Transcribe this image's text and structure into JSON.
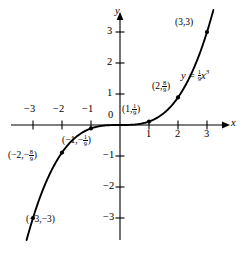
{
  "figure": {
    "caption": ""
  },
  "axes": {
    "x_axis_name": "x",
    "y_axis_name": "y",
    "origin_label": "0",
    "x_ticks": [
      {
        "value": -3,
        "label": "−3"
      },
      {
        "value": -2,
        "label": "−2"
      },
      {
        "value": -1,
        "label": "−1"
      },
      {
        "value": 1,
        "label": "1"
      },
      {
        "value": 2,
        "label": "2"
      },
      {
        "value": 3,
        "label": "3"
      }
    ],
    "y_ticks": [
      {
        "value": 3,
        "label": "3"
      },
      {
        "value": 2,
        "label": "2"
      },
      {
        "value": 1,
        "label": "1"
      },
      {
        "value": -1,
        "label": "−1"
      },
      {
        "value": -2,
        "label": "−2"
      },
      {
        "value": -3,
        "label": "−3"
      }
    ]
  },
  "equation": {
    "lhs": "y",
    "equals": "=",
    "coefficient_numerator": "1",
    "coefficient_denominator": "9",
    "variable": "x",
    "exponent": "3"
  },
  "points": [
    {
      "name": "point-neg3",
      "x": -3,
      "y": -3,
      "open": "(",
      "x_text": "−3,",
      "y_text": "−3",
      "close": ")",
      "has_fraction": false
    },
    {
      "name": "point-neg2",
      "x": -2,
      "y": -0.8889,
      "open": "(",
      "x_text": "−2,",
      "y_text": "−",
      "frac_num": "8",
      "frac_den": "9",
      "close": ")",
      "has_fraction": true
    },
    {
      "name": "point-neg1",
      "x": -1,
      "y": -0.1111,
      "open": "(",
      "x_text": "−1,",
      "y_text": "−",
      "frac_num": "1",
      "frac_den": "9",
      "close": ")",
      "has_fraction": true
    },
    {
      "name": "point-pos1",
      "x": 1,
      "y": 0.1111,
      "open": "(",
      "x_text": "1,",
      "y_text": "",
      "frac_num": "1",
      "frac_den": "9",
      "close": ")",
      "has_fraction": true
    },
    {
      "name": "point-pos2",
      "x": 2,
      "y": 0.8889,
      "open": "(",
      "x_text": "2,",
      "y_text": "",
      "frac_num": "8",
      "frac_den": "9",
      "close": ")",
      "has_fraction": true
    },
    {
      "name": "point-pos3",
      "x": 3,
      "y": 3,
      "open": "(",
      "x_text": "3,",
      "y_text": "3",
      "close": ")",
      "has_fraction": false
    }
  ],
  "colors": {
    "curve": "#000000",
    "axis": "#000000",
    "background": "#ffffff",
    "text": "#000000"
  },
  "chart_data": {
    "type": "line",
    "title": "",
    "xlabel": "x",
    "ylabel": "y",
    "xlim": [
      -3.6,
      3.6
    ],
    "ylim": [
      -3.6,
      3.6
    ],
    "grid": false,
    "legend": false,
    "function": "y = (1/9) x^3",
    "xticks": [
      -3,
      -2,
      -1,
      0,
      1,
      2,
      3
    ],
    "yticks": [
      -3,
      -2,
      -1,
      0,
      1,
      2,
      3
    ],
    "series": [
      {
        "name": "y = (1/9)x^3",
        "x": [
          -3.2,
          -3,
          -2.5,
          -2,
          -1.5,
          -1,
          -0.5,
          0,
          0.5,
          1,
          1.5,
          2,
          2.5,
          3,
          3.2
        ],
        "values": [
          -3.64,
          -3,
          -1.736,
          -0.889,
          -0.375,
          -0.111,
          -0.0139,
          0,
          0.0139,
          0.111,
          0.375,
          0.889,
          1.736,
          3,
          3.64
        ]
      }
    ],
    "marked_points": [
      {
        "x": -3,
        "y": -3,
        "label": "(−3,−3)"
      },
      {
        "x": -2,
        "y": -0.889,
        "label": "(−2,−8/9)"
      },
      {
        "x": -1,
        "y": -0.111,
        "label": "(−1,−1/9)"
      },
      {
        "x": 1,
        "y": 0.111,
        "label": "(1,1/9)"
      },
      {
        "x": 2,
        "y": 0.889,
        "label": "(2,8/9)"
      },
      {
        "x": 3,
        "y": 3,
        "label": "(3,3)"
      }
    ]
  }
}
